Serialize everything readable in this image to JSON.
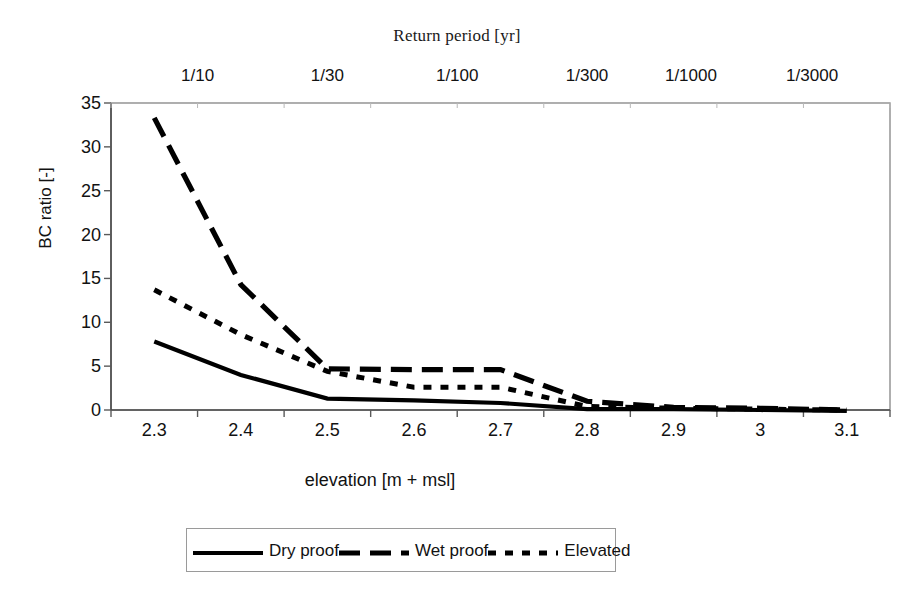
{
  "chart_data": {
    "type": "line",
    "title": "Return period [yr]",
    "xlabel": "elevation [m + msl]",
    "ylabel": "BC ratio [-]",
    "grid": false,
    "legend_position": "bottom",
    "xlim": [
      2.25,
      3.15
    ],
    "ylim": [
      0,
      35
    ],
    "ytick_step": 5,
    "yticks": [
      "0",
      "5",
      "10",
      "15",
      "20",
      "25",
      "30",
      "35"
    ],
    "categories": [
      "2.3",
      "2.4",
      "2.5",
      "2.6",
      "2.7",
      "2.8",
      "2.9",
      "3",
      "3.1"
    ],
    "x": [
      2.3,
      2.4,
      2.5,
      2.6,
      2.7,
      2.8,
      2.9,
      3.0,
      3.1
    ],
    "secondary_axis": {
      "label": "Return period [yr]",
      "position": "top",
      "ticks": [
        "1/10",
        "1/30",
        "1/100",
        "1/300",
        "1/1000",
        "1/3000"
      ],
      "tick_x_values": [
        2.35,
        2.5,
        2.65,
        2.8,
        2.92,
        3.06
      ]
    },
    "series": [
      {
        "name": "Dry proof",
        "style": "solid",
        "color": "#000000",
        "values": [
          7.8,
          4.0,
          1.3,
          1.1,
          0.8,
          0.1,
          0.1,
          0.0,
          -0.1
        ]
      },
      {
        "name": "Wet proof",
        "style": "long-dash",
        "color": "#000000",
        "values": [
          33.3,
          14.3,
          4.7,
          4.6,
          4.6,
          1.0,
          0.3,
          0.2,
          0.0
        ]
      },
      {
        "name": "Elevated",
        "style": "dotted",
        "color": "#000000",
        "values": [
          13.7,
          8.6,
          4.4,
          2.6,
          2.6,
          0.4,
          0.2,
          0.1,
          0.0
        ]
      }
    ]
  },
  "legend": {
    "items": [
      {
        "label": "Dry proof",
        "style": "solid"
      },
      {
        "label": "Wet proof",
        "style": "long-dash"
      },
      {
        "label": "Elevated",
        "style": "dotted"
      }
    ]
  },
  "axes": {
    "plot_left": 111,
    "plot_right": 890,
    "plot_top": 103,
    "plot_bottom": 410
  }
}
